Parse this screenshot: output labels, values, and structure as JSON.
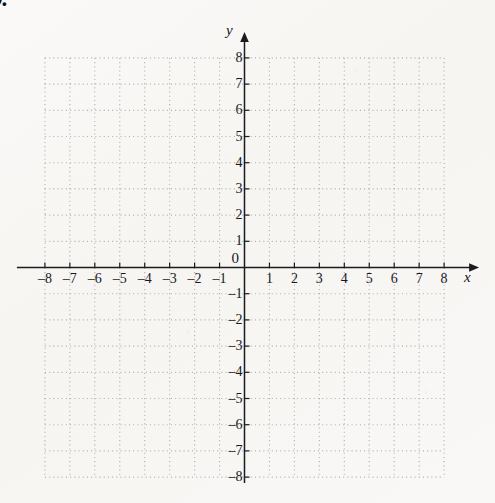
{
  "worksheet": {
    "item_number": "9.",
    "origin_label": "0"
  },
  "chart_data": {
    "type": "scatter",
    "title": "",
    "subtitle": "",
    "xlabel": "x",
    "ylabel": "y",
    "xlim": [
      -8,
      8
    ],
    "ylim": [
      -8,
      8
    ],
    "grid": true,
    "grid_style": "dotted",
    "grid_step": 1,
    "legend": "none",
    "series": [],
    "values": [],
    "x_tick_labels": [
      "-8",
      "-7",
      "-6",
      "-5",
      "-4",
      "-3",
      "-2",
      "-1",
      "1",
      "2",
      "3",
      "4",
      "5",
      "6",
      "7",
      "8"
    ],
    "x_tick_values": [
      -8,
      -7,
      -6,
      -5,
      -4,
      -3,
      -2,
      -1,
      1,
      2,
      3,
      4,
      5,
      6,
      7,
      8
    ],
    "y_tick_labels": [
      "8",
      "7",
      "6",
      "5",
      "4",
      "3",
      "2",
      "1",
      "-1",
      "-2",
      "-3",
      "-4",
      "-5",
      "-6",
      "-7",
      "-8"
    ],
    "y_tick_values": [
      8,
      7,
      6,
      5,
      4,
      3,
      2,
      1,
      -1,
      -2,
      -3,
      -4,
      -5,
      -6,
      -7,
      -8
    ],
    "annotations": [
      "0"
    ]
  },
  "style": {
    "paper_color": "#f8f7f5",
    "grid_color": "#b6b4b2",
    "axis_color": "#1b1c20",
    "text_color": "#17181c"
  }
}
